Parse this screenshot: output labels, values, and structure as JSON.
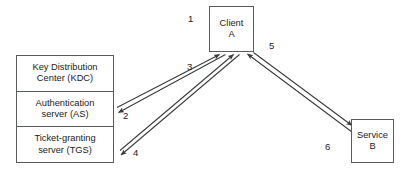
{
  "diagram": {
    "background_color": "#ffffff",
    "stroke_color": "#585b5e",
    "arrow_color": "#3a3a3a",
    "text_color": "#1b1b1b",
    "nodes": {
      "kdc": {
        "name": "Key Distribution Center",
        "cells": [
          {
            "line1": "Key Distribution",
            "line2": "Center (KDC)"
          },
          {
            "line1": "Authentication",
            "line2": "server (AS)"
          },
          {
            "line1": "Ticket-granting",
            "line2": "server (TGS)"
          }
        ]
      },
      "client": {
        "line1": "Client",
        "line2": "A"
      },
      "service": {
        "line1": "Service",
        "line2": "B"
      }
    },
    "edges": [
      {
        "id": "1",
        "label": "1",
        "from": "authentication-server",
        "to": "client",
        "direction": "to-client"
      },
      {
        "id": "2",
        "label": "2",
        "from": "client",
        "to": "authentication-server",
        "direction": "to-kdc"
      },
      {
        "id": "3",
        "label": "3",
        "from": "ticket-granting-server",
        "to": "client",
        "direction": "to-client"
      },
      {
        "id": "4",
        "label": "4",
        "from": "client",
        "to": "ticket-granting-server",
        "direction": "to-kdc"
      },
      {
        "id": "5",
        "label": "5",
        "from": "client",
        "to": "service",
        "direction": "to-service"
      },
      {
        "id": "6",
        "label": "6",
        "from": "service",
        "to": "client",
        "direction": "to-client"
      }
    ]
  }
}
